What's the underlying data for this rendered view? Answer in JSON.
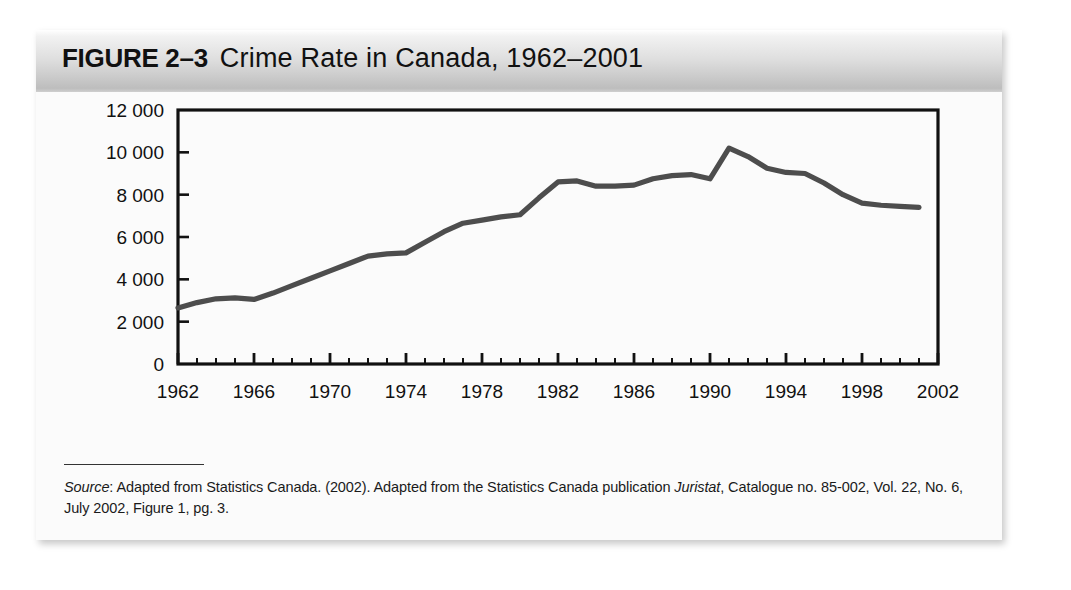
{
  "figure": {
    "label": "FIGURE 2–3",
    "title": "Crime Rate in Canada, 1962–2001"
  },
  "source": {
    "lead_label": "Source",
    "text": ": Adapted from Statistics Canada. (2002). Adapted from the Statistics Canada publication ",
    "publication": "Juristat",
    "text_tail": ", Catalogue no. 85-002, Vol. 22, No. 6, July 2002, Figure 1, pg. 3."
  },
  "colors": {
    "line": "#4d4d4d",
    "axis": "#111111",
    "band_top": "#ffffff",
    "band_bottom": "#bdbdbd",
    "page": "#fbfbfb"
  },
  "chart_data": {
    "type": "line",
    "title": "Crime Rate in Canada, 1962–2001",
    "xlabel": "",
    "ylabel": "",
    "xlim": [
      1962,
      2002
    ],
    "ylim": [
      0,
      12000
    ],
    "grid": false,
    "legend": "none",
    "x_tick_labels": [
      "1962",
      "1966",
      "1970",
      "1974",
      "1978",
      "1982",
      "1986",
      "1990",
      "1994",
      "1998",
      "2002"
    ],
    "x_tick_values": [
      1962,
      1966,
      1970,
      1974,
      1978,
      1982,
      1986,
      1990,
      1994,
      1998,
      2002
    ],
    "x_minor_tick_step": 1,
    "y_tick_labels": [
      "0",
      "2 000",
      "4 000",
      "6 000",
      "8 000",
      "10 000",
      "12 000"
    ],
    "y_tick_values": [
      0,
      2000,
      4000,
      6000,
      8000,
      10000,
      12000
    ],
    "series": [
      {
        "name": "Crime rate per 100 000 population",
        "x": [
          1962,
          1963,
          1964,
          1965,
          1966,
          1967,
          1968,
          1969,
          1970,
          1971,
          1972,
          1973,
          1974,
          1975,
          1976,
          1977,
          1978,
          1979,
          1980,
          1981,
          1982,
          1983,
          1984,
          1985,
          1986,
          1987,
          1988,
          1989,
          1990,
          1991,
          1992,
          1993,
          1994,
          1995,
          1996,
          1997,
          1998,
          1999,
          2000,
          2001
        ],
        "values": [
          2650,
          2900,
          3080,
          3120,
          3050,
          3350,
          3700,
          4050,
          4400,
          4750,
          5100,
          5200,
          5250,
          5750,
          6250,
          6650,
          6800,
          6950,
          7050,
          7850,
          8600,
          8650,
          8400,
          8400,
          8450,
          8750,
          8900,
          8950,
          8750,
          10200,
          9800,
          9250,
          9050,
          9000,
          8550,
          8000,
          7600,
          7500,
          7450,
          7400
        ]
      }
    ],
    "annotations": {
      "peak_year": 1991,
      "peak_value": 10200,
      "start_value": 2650,
      "end_value": 7400
    }
  }
}
